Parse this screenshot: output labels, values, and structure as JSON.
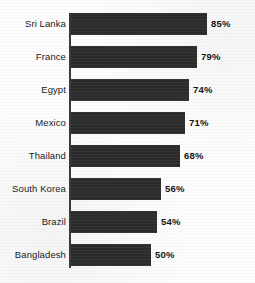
{
  "chart_data": {
    "type": "bar",
    "orientation": "horizontal",
    "title": "",
    "subtitle": "",
    "xlabel": "",
    "ylabel": "",
    "xlim": [
      0,
      100
    ],
    "grid": false,
    "legend": null,
    "value_suffix": "%",
    "categories": [
      "Sri Lanka",
      "France",
      "Egypt",
      "Mexico",
      "Thailand",
      "South Korea",
      "Brazil",
      "Bangladesh"
    ],
    "values": [
      85,
      79,
      74,
      71,
      68,
      56,
      54,
      50
    ],
    "value_labels": [
      "85%",
      "79%",
      "74%",
      "71%",
      "68%",
      "56%",
      "54%",
      "50%"
    ],
    "bars": [
      {
        "category": "Sri Lanka",
        "value": 85,
        "label": "85%"
      },
      {
        "category": "France",
        "value": 79,
        "label": "79%"
      },
      {
        "category": "Egypt",
        "value": 74,
        "label": "74%"
      },
      {
        "category": "Mexico",
        "value": 71,
        "label": "71%"
      },
      {
        "category": "Thailand",
        "value": 68,
        "label": "68%"
      },
      {
        "category": "South Korea",
        "value": 56,
        "label": "56%"
      },
      {
        "category": "Brazil",
        "value": 54,
        "label": "54%"
      },
      {
        "category": "Bangladesh",
        "value": 50,
        "label": "50%"
      }
    ],
    "colors": {
      "bar": "#2b2b2b",
      "axis": "#3a3a3a",
      "background": "#fdfdfd",
      "label_text": "#1a1a1a",
      "value_text": "#151515"
    }
  }
}
